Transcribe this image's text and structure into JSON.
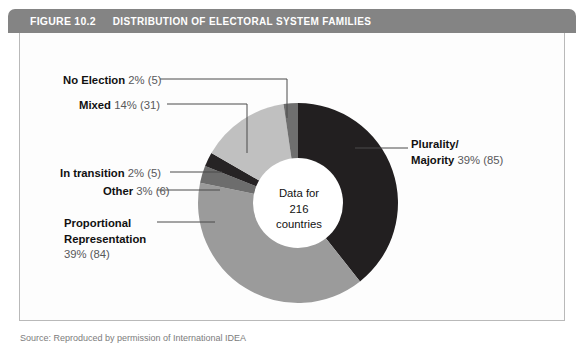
{
  "header": {
    "figure_number": "FIGURE 10.2",
    "title": "DISTRIBUTION OF ELECTORAL SYSTEM FAMILIES",
    "bar_color": "#848484",
    "text_color": "#ffffff"
  },
  "center": {
    "line1": "Data for",
    "line2": "216",
    "line3": "countries"
  },
  "labels": {
    "no_election": {
      "name": "No Election",
      "value": "2% (5)"
    },
    "mixed": {
      "name": "Mixed",
      "value": "14% (31)"
    },
    "in_transition": {
      "name": "In transition",
      "value": "2% (5)"
    },
    "other": {
      "name": "Other",
      "value": "3% (6)"
    },
    "proportional": {
      "name_line1": "Proportional",
      "name_line2": "Representation",
      "value": "39% (84)"
    },
    "plurality": {
      "name_line1": "Plurality/",
      "name_line2": "Majority",
      "value": "39% (85)"
    }
  },
  "source": {
    "text": "Source: Reproduced by permission of International IDEA"
  },
  "chart_data": {
    "type": "pie",
    "title": "DISTRIBUTION OF ELECTORAL SYSTEM FAMILIES",
    "subtitle": "Data for 216 countries",
    "total": 216,
    "units": "countries",
    "donut": true,
    "inner_radius_ratio": 0.45,
    "start_angle_deg": 0,
    "direction": "clockwise",
    "legend": "labels-with-leader-lines",
    "grid": false,
    "categories": [
      "Plurality/Majority",
      "Proportional Representation",
      "Other",
      "In transition",
      "Mixed",
      "No Election"
    ],
    "values": [
      85,
      84,
      6,
      5,
      31,
      5
    ],
    "percents": [
      39,
      39,
      3,
      2,
      14,
      2
    ],
    "colors": [
      "#221f20",
      "#9b9b9b",
      "#6d6d6d",
      "#262324",
      "#c0c0c0",
      "#6f6f6f"
    ],
    "slices": [
      {
        "label": "Plurality/Majority",
        "value": 85,
        "percent": 39,
        "color": "#221f20"
      },
      {
        "label": "Proportional Representation",
        "value": 84,
        "percent": 39,
        "color": "#9b9b9b"
      },
      {
        "label": "Other",
        "value": 6,
        "percent": 3,
        "color": "#6d6d6d"
      },
      {
        "label": "In transition",
        "value": 5,
        "percent": 2,
        "color": "#262324"
      },
      {
        "label": "Mixed",
        "value": 31,
        "percent": 14,
        "color": "#c0c0c0"
      },
      {
        "label": "No Election",
        "value": 5,
        "percent": 2,
        "color": "#6f6f6f"
      }
    ]
  }
}
